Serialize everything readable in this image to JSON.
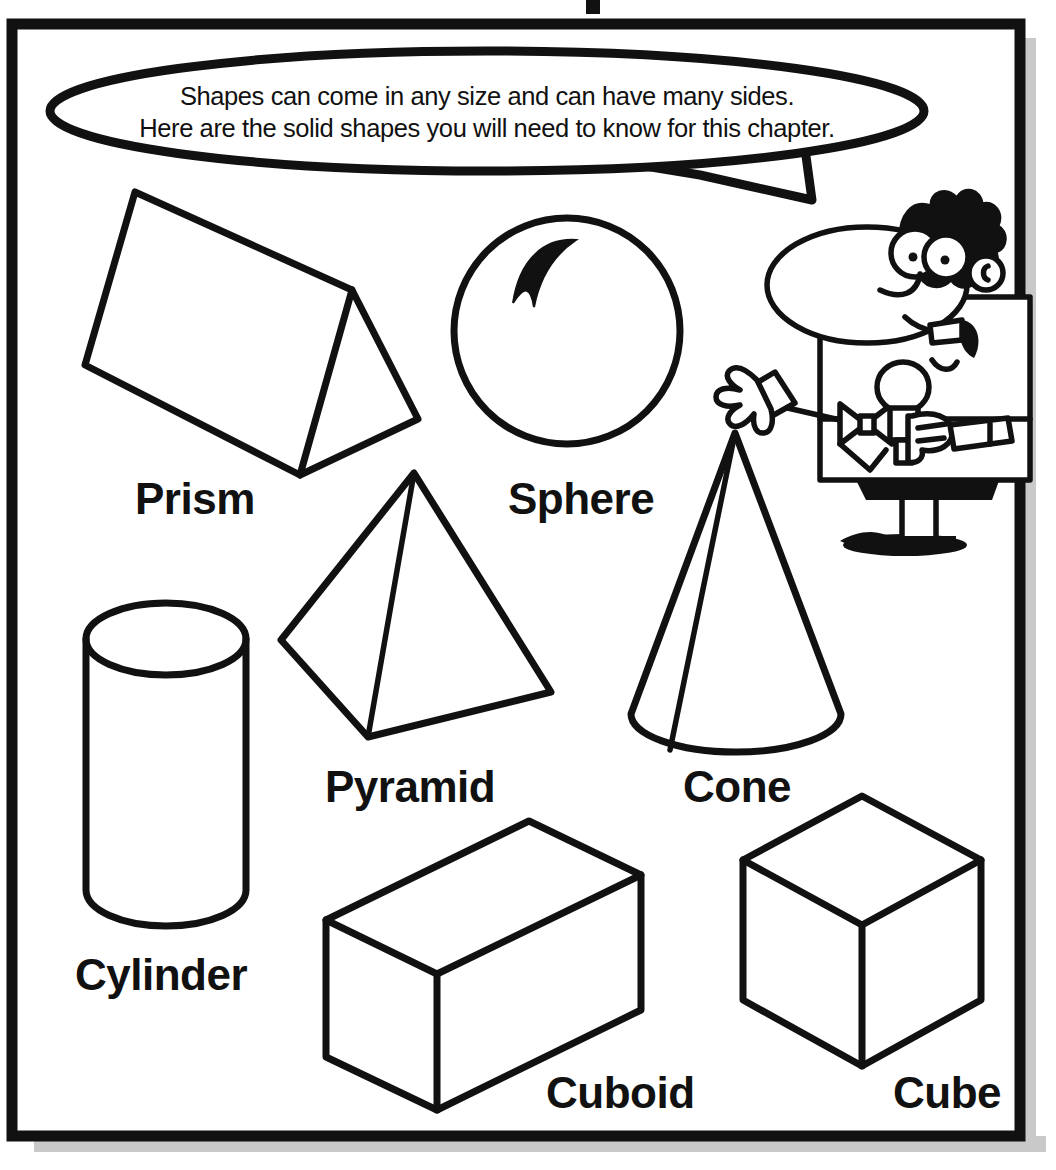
{
  "page": {
    "type": "worksheet",
    "title_fragment_visible": "",
    "background_color": "#ffffff",
    "ink_color": "#111111",
    "shadow_color": "#c9c9c9",
    "border": {
      "name": "page-frame",
      "style": "thick black rectangle with gray drop shadow on right and bottom"
    }
  },
  "speech_bubble": {
    "name": "instruction-speech-bubble",
    "line1": "Shapes can come in any size and can have many sides.",
    "line2": "Here are the solid shapes you will need to know for this chapter.",
    "tail_direction": "down-right toward teacher"
  },
  "character": {
    "name": "cartoon-teacher",
    "description": "smiling man with spiky hair, large nose, glasses-free big eyes, bow tie, holding a microphone, waving with gloved hand",
    "holds": "microphone",
    "wears": "bow-tie"
  },
  "shapes": [
    {
      "id": "prism",
      "label": "Prism",
      "icon": "triangular-prism-icon",
      "label_x": 135,
      "label_y": 514
    },
    {
      "id": "sphere",
      "label": "Sphere",
      "icon": "sphere-icon",
      "label_x": 508,
      "label_y": 514
    },
    {
      "id": "pyramid",
      "label": "Pyramid",
      "icon": "square-pyramid-icon",
      "label_x": 325,
      "label_y": 802
    },
    {
      "id": "cone",
      "label": "Cone",
      "icon": "cone-icon",
      "label_x": 683,
      "label_y": 802
    },
    {
      "id": "cylinder",
      "label": "Cylinder",
      "icon": "cylinder-icon",
      "label_x": 75,
      "label_y": 990
    },
    {
      "id": "cuboid",
      "label": "Cuboid",
      "icon": "cuboid-icon",
      "label_x": 546,
      "label_y": 1108
    },
    {
      "id": "cube",
      "label": "Cube",
      "icon": "cube-icon",
      "label_x": 893,
      "label_y": 1108
    }
  ]
}
